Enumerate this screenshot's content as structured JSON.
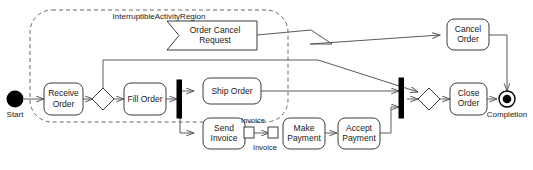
{
  "diagram": {
    "type": "uml-activity-diagram",
    "canvas": {
      "width": 533,
      "height": 170
    },
    "colors": {
      "background": "#ffffff",
      "node_stroke": "#3c3c3c",
      "edge_stroke": "#5a5a5a",
      "region_stroke": "#6a6a6a",
      "bar_fill": "#000000",
      "text": "#1a1a1a"
    }
  },
  "region": {
    "name": "interruptible-activity-region",
    "label": "InterruptibleActivityRegion"
  },
  "nodes": {
    "start": {
      "label": "Start",
      "type": "initial-node"
    },
    "receive_order": {
      "label_line1": "Receive",
      "label_line2": "Order",
      "type": "action"
    },
    "decision": {
      "label": "",
      "type": "decision-node"
    },
    "fill_order": {
      "label_line1": "Fill Order",
      "label_line2": "",
      "type": "action"
    },
    "fork": {
      "label": "",
      "type": "fork-node"
    },
    "ship_order": {
      "label_line1": "Ship Order",
      "label_line2": "",
      "type": "action"
    },
    "send_invoice": {
      "label_line1": "Send",
      "label_line2": "Invoice",
      "type": "action"
    },
    "make_payment": {
      "label_line1": "Make",
      "label_line2": "Payment",
      "type": "action"
    },
    "accept_payment": {
      "label_line1": "Accept",
      "label_line2": "Payment",
      "type": "action"
    },
    "order_cancel_request": {
      "label_line1": "Order Cancel",
      "label_line2": "Request",
      "type": "accept-event-action"
    },
    "cancel_order": {
      "label_line1": "Cancel",
      "label_line2": "Order",
      "type": "action"
    },
    "join": {
      "label": "",
      "type": "join-node"
    },
    "merge": {
      "label": "",
      "type": "merge-node"
    },
    "close_order": {
      "label_line1": "Close",
      "label_line2": "Order",
      "type": "action"
    },
    "completion": {
      "label": "Completion",
      "type": "activity-final-node"
    }
  },
  "pins": {
    "invoice_output": {
      "label": "Invoice",
      "owner": "send_invoice",
      "kind": "output-pin"
    },
    "invoice_input": {
      "label": "Invoice",
      "owner": "make_payment",
      "kind": "input-pin"
    }
  },
  "edges": [
    {
      "name": "start-to-receive-order",
      "from": "start",
      "to": "receive_order"
    },
    {
      "name": "receive-order-to-decision",
      "from": "receive_order",
      "to": "decision"
    },
    {
      "name": "decision-to-fill-order",
      "from": "decision",
      "to": "fill_order"
    },
    {
      "name": "decision-to-merge",
      "from": "decision",
      "to": "merge"
    },
    {
      "name": "fill-order-to-fork",
      "from": "fill_order",
      "to": "fork"
    },
    {
      "name": "fork-to-ship-order",
      "from": "fork",
      "to": "ship_order"
    },
    {
      "name": "fork-to-send-invoice",
      "from": "fork",
      "to": "send_invoice"
    },
    {
      "name": "ship-order-to-join",
      "from": "ship_order",
      "to": "join"
    },
    {
      "name": "send-invoice-to-make-payment",
      "from": "invoice_output",
      "to": "invoice_input"
    },
    {
      "name": "make-payment-to-accept-payment",
      "from": "make_payment",
      "to": "accept_payment"
    },
    {
      "name": "accept-payment-to-join",
      "from": "accept_payment",
      "to": "join"
    },
    {
      "name": "join-to-merge",
      "from": "join",
      "to": "merge"
    },
    {
      "name": "merge-to-close-order",
      "from": "merge",
      "to": "close_order"
    },
    {
      "name": "close-order-to-completion",
      "from": "close_order",
      "to": "completion"
    },
    {
      "name": "order-cancel-request-to-cancel-order",
      "from": "order_cancel_request",
      "to": "cancel_order",
      "kind": "interrupting-edge"
    },
    {
      "name": "cancel-order-to-completion",
      "from": "cancel_order",
      "to": "completion"
    }
  ]
}
